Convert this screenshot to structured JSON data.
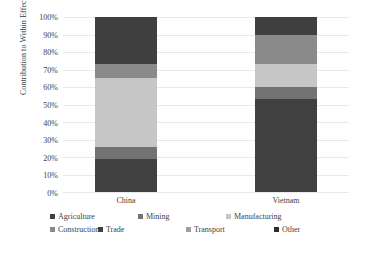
{
  "chart_data": {
    "type": "bar",
    "subtype": "stacked-100-percent",
    "title": "",
    "xlabel": "",
    "ylabel": "Contribution to Within Effect",
    "categories": [
      "China",
      "Vietnam"
    ],
    "ylim": [
      0,
      100
    ],
    "y_tick_labels": [
      "100%",
      "90%",
      "80%",
      "70%",
      "60%",
      "50%",
      "40%",
      "30%",
      "20%",
      "10%",
      "0%"
    ],
    "y_tick_values": [
      100,
      90,
      80,
      70,
      60,
      50,
      40,
      30,
      20,
      10,
      0
    ],
    "grid": true,
    "legend_position": "bottom",
    "series": [
      {
        "name": "Agriculture",
        "color": "#404040",
        "values": [
          19,
          53
        ]
      },
      {
        "name": "Mining",
        "color": "#737373",
        "values": [
          7,
          7
        ]
      },
      {
        "name": "Manufacturing",
        "color": "#c6c6c6",
        "values": [
          39,
          13
        ]
      },
      {
        "name": "Construction",
        "color": "#8a8a8a",
        "values": [
          8,
          17
        ]
      },
      {
        "name": "Trade",
        "color": "#3f3f3f",
        "values": [
          27,
          10
        ]
      },
      {
        "name": "Transport",
        "color": "#9e9e9e",
        "values": [
          0,
          0
        ]
      },
      {
        "name": "Other",
        "color": "#2e2e2e",
        "values": [
          0,
          0
        ]
      }
    ]
  },
  "axis": {
    "y_title": "Contribution to Within Effect",
    "ticks": [
      "100%",
      "90%",
      "80%",
      "70%",
      "60%",
      "50%",
      "40%",
      "30%",
      "20%",
      "10%",
      "0%"
    ]
  },
  "categories": {
    "china": "China",
    "vietnam": "Vietnam"
  },
  "legend": {
    "items": [
      {
        "label": "Agriculture",
        "color": "#404040"
      },
      {
        "label": "Mining",
        "color": "#737373"
      },
      {
        "label": "Manufacturing",
        "color": "#c6c6c6"
      },
      {
        "label": "Construction",
        "color": "#8a8a8a"
      },
      {
        "label": "Trade",
        "color": "#3f3f3f"
      },
      {
        "label": "Transport",
        "color": "#9e9e9e"
      },
      {
        "label": "Other",
        "color": "#2e2e2e"
      }
    ]
  }
}
